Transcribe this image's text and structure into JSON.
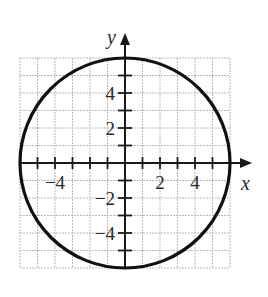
{
  "chart_data": {
    "type": "line",
    "title": "",
    "equation": "x^2 + y^2 = 36",
    "curve": {
      "shape": "circle",
      "center": [
        0,
        0
      ],
      "radius": 6
    },
    "xlabel": "x",
    "ylabel": "y",
    "xlim": [
      -6,
      6
    ],
    "ylim": [
      -6,
      6
    ],
    "grid": true,
    "grid_step": 1,
    "x_tick_labels": [
      {
        "value": -4,
        "label": "−4"
      },
      {
        "value": 2,
        "label": "2"
      },
      {
        "value": 4,
        "label": "4"
      }
    ],
    "y_tick_labels": [
      {
        "value": 4,
        "label": "4"
      },
      {
        "value": 2,
        "label": "2"
      },
      {
        "value": -2,
        "label": "−2"
      },
      {
        "value": -4,
        "label": "−4"
      }
    ],
    "legend": null
  },
  "layout": {
    "origin_px": [
      125,
      163
    ],
    "unit_px": 17.5,
    "x_arrow_tip_px": 252,
    "y_arrow_tip_px": 33,
    "colors": {
      "grid": "#b8b8b8",
      "axis": "#1a1a1a",
      "curve": "#111111",
      "text": "#2a2a2a"
    }
  }
}
